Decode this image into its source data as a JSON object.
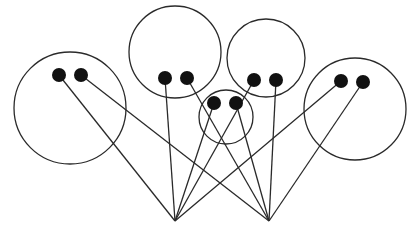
{
  "diagram": {
    "width": 418,
    "height": 236,
    "colors": {
      "background": "#ffffff",
      "stroke": "#2a2a2a",
      "node": "#111111"
    },
    "apexes": [
      {
        "id": "A",
        "x": 175,
        "y": 221
      },
      {
        "id": "B",
        "x": 269,
        "y": 221
      }
    ],
    "groups": [
      {
        "id": "g1",
        "cx": 70,
        "cy": 108,
        "r": 56,
        "nodes": [
          {
            "id": "g1a",
            "x": 59,
            "y": 75,
            "to": "A"
          },
          {
            "id": "g1b",
            "x": 81,
            "y": 75,
            "to": "B"
          }
        ]
      },
      {
        "id": "g2",
        "cx": 175,
        "cy": 52,
        "r": 46,
        "nodes": [
          {
            "id": "g2a",
            "x": 165,
            "y": 78,
            "to": "A"
          },
          {
            "id": "g2b",
            "x": 187,
            "y": 78,
            "to": "B"
          }
        ]
      },
      {
        "id": "g3",
        "cx": 266,
        "cy": 58,
        "r": 39,
        "nodes": [
          {
            "id": "g3a",
            "x": 254,
            "y": 80,
            "to": "A"
          },
          {
            "id": "g3b",
            "x": 276,
            "y": 80,
            "to": "B"
          }
        ]
      },
      {
        "id": "g4",
        "cx": 226,
        "cy": 117,
        "r": 27,
        "nodes": [
          {
            "id": "g4a",
            "x": 214,
            "y": 103,
            "to": "A"
          },
          {
            "id": "g4b",
            "x": 236,
            "y": 103,
            "to": "B"
          }
        ]
      },
      {
        "id": "g5",
        "cx": 355,
        "cy": 109,
        "r": 51,
        "nodes": [
          {
            "id": "g5a",
            "x": 341,
            "y": 81,
            "to": "A"
          },
          {
            "id": "g5b",
            "x": 363,
            "y": 82,
            "to": "B"
          }
        ]
      }
    ],
    "node_radius": 7
  }
}
